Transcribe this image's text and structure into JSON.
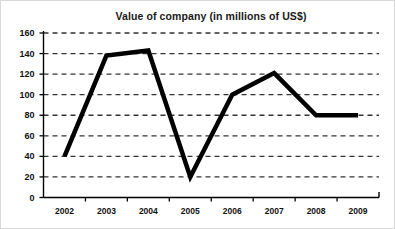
{
  "chart_data": {
    "type": "line",
    "title": "Value of company (in millions of US$)",
    "xlabel": "",
    "ylabel": "",
    "categories": [
      "2002",
      "2003",
      "2004",
      "2005",
      "2006",
      "2007",
      "2008",
      "2009"
    ],
    "values": [
      40,
      138,
      143,
      20,
      100,
      121,
      80,
      80
    ],
    "series": [
      {
        "name": "Value of company",
        "values": [
          40,
          138,
          143,
          20,
          100,
          121,
          80,
          80
        ]
      }
    ],
    "ylim": [
      0,
      160
    ],
    "yticks": [
      0,
      20,
      40,
      60,
      80,
      100,
      120,
      140,
      160
    ],
    "ytick_labels": [
      "0",
      "20",
      "40",
      "60",
      "80",
      "100",
      "120",
      "140",
      "160"
    ],
    "xticks": [
      "2002",
      "2003",
      "2004",
      "2005",
      "2006",
      "2007",
      "2008",
      "2009"
    ],
    "grid": true,
    "grid_axis": "y",
    "grid_style": "dashed",
    "legend": false,
    "legend_position": "none",
    "colors": {
      "line": "#000000",
      "grid": "#333333",
      "axis": "#000000",
      "text": "#111111",
      "background": "#ffffff"
    },
    "line_width": 4.5,
    "markers": "none"
  }
}
